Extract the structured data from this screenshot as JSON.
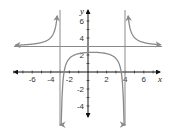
{
  "chart_data": {
    "type": "line",
    "title": "",
    "xlabel": "x",
    "ylabel": "y",
    "xlim": [
      -8,
      8
    ],
    "ylim": [
      -6,
      8
    ],
    "x_ticks": [
      -6,
      -4,
      -2,
      2,
      4,
      6
    ],
    "y_ticks": [
      -4,
      -2,
      2,
      4,
      6
    ],
    "grid": false,
    "asymptotes": {
      "horizontal": [
        3
      ],
      "vertical": [
        -3,
        4
      ]
    },
    "series": [
      {
        "name": "rational function",
        "description": "Three branches with vertical asymptotes x=-3 and x=4, horizontal asymptote y=3",
        "branches": [
          {
            "x": [
              -7.5,
              -6,
              -5,
              -4,
              -3.5,
              -3.2
            ],
            "y": [
              3.1,
              3.3,
              3.5,
              4.2,
              5.5,
              8
            ]
          },
          {
            "x": [
              -2.9,
              -2.57,
              -2,
              -1,
              0,
              0.5,
              1,
              2,
              3,
              3.57,
              3.9
            ],
            "y": [
              -6,
              0,
              1.6,
              2.2,
              2.3,
              2.3,
              2.3,
              2.2,
              1.6,
              0,
              -6
            ]
          },
          {
            "x": [
              4.2,
              4.5,
              5,
              6,
              7,
              7.5
            ],
            "y": [
              8,
              5.5,
              4.2,
              3.5,
              3.2,
              3.1
            ]
          }
        ],
        "color": "#8a8a8a",
        "arrows": "both ends of each branch"
      }
    ]
  },
  "labels": {
    "x_axis": "x",
    "y_axis": "y",
    "x_ticks": [
      "-6",
      "-4",
      "-2",
      "2",
      "4",
      "6"
    ],
    "y_ticks": [
      "6",
      "4",
      "2",
      "-2",
      "-4"
    ]
  }
}
